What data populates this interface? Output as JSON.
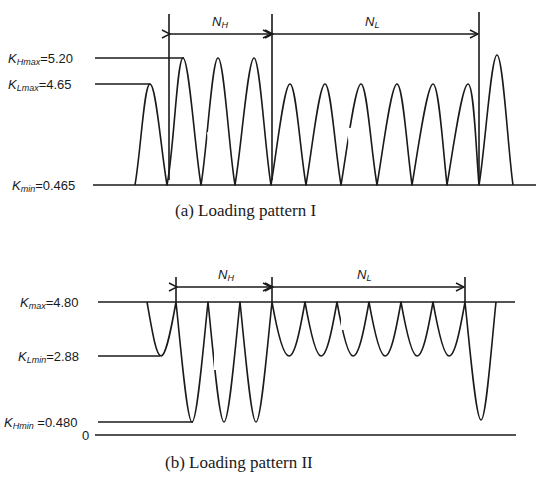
{
  "pattern_1": {
    "caption": "(a) Loading pattern I",
    "labels": {
      "k_hmax": {
        "symbol": "K",
        "sub": "Hmax",
        "value": "=5.20"
      },
      "k_lmax": {
        "symbol": "K",
        "sub": "Lmax",
        "value": "=4.65"
      },
      "k_min": {
        "symbol": "K",
        "sub": "min",
        "value": "=0.465"
      }
    },
    "intervals": {
      "n_h": {
        "symbol": "N",
        "sub": "H"
      },
      "n_l": {
        "symbol": "N",
        "sub": "L"
      }
    }
  },
  "pattern_2": {
    "caption": "(b) Loading pattern II",
    "labels": {
      "k_max": {
        "symbol": "K",
        "sub": "max",
        "value": "=4.80"
      },
      "k_lmin": {
        "symbol": "K",
        "sub": "Lmin",
        "value": "=2.88"
      },
      "k_hmin": {
        "symbol": "K",
        "sub": "Hmin",
        "value": " =0.480"
      },
      "zero": {
        "value": "0"
      }
    },
    "intervals": {
      "n_h": {
        "symbol": "N",
        "sub": "H"
      },
      "n_l": {
        "symbol": "N",
        "sub": "L"
      }
    }
  },
  "colors": {
    "ink": "#1a1a1a",
    "background": "#ffffff"
  }
}
